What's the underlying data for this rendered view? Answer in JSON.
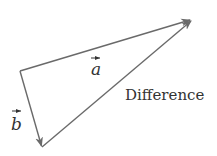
{
  "diagram": {
    "colors": {
      "line": "#6a6a6a",
      "text": "#333333",
      "background": "#ffffff"
    },
    "points": {
      "origin": {
        "x": 20,
        "y": 71
      },
      "b_tip": {
        "x": 42,
        "y": 147
      },
      "a_tip": {
        "x": 192,
        "y": 19
      }
    },
    "vectors": [
      {
        "id": "a",
        "label": "a",
        "from": "origin",
        "to": "a_tip"
      },
      {
        "id": "b",
        "label": "b",
        "from": "origin",
        "to": "b_tip"
      },
      {
        "id": "difference",
        "label": "Difference",
        "from": "b_tip",
        "to": "a_tip"
      }
    ],
    "labels": {
      "a": "a",
      "b": "b",
      "difference": "Difference"
    }
  }
}
